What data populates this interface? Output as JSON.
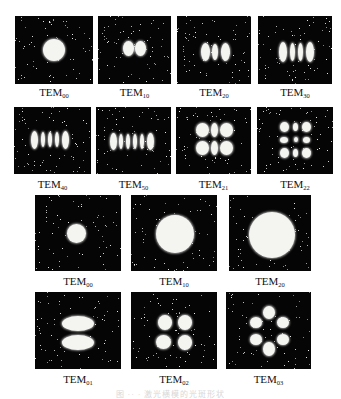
{
  "figure": {
    "rows": [
      {
        "name": "hermite-gaussian-row-1",
        "panels": [
          {
            "base": "TEM",
            "sub": "00",
            "pattern": "single-spot"
          },
          {
            "base": "TEM",
            "sub": "10",
            "pattern": "2-lobes-horizontal"
          },
          {
            "base": "TEM",
            "sub": "20",
            "pattern": "3-lobes-horizontal"
          },
          {
            "base": "TEM",
            "sub": "30",
            "pattern": "4-lobes-horizontal"
          }
        ]
      },
      {
        "name": "hermite-gaussian-row-2",
        "panels": [
          {
            "base": "TEM",
            "sub": "40",
            "pattern": "5-lobes-horizontal"
          },
          {
            "base": "TEM",
            "sub": "50",
            "pattern": "6-lobes-horizontal"
          },
          {
            "base": "TEM",
            "sub": "21",
            "pattern": "3x2-grid"
          },
          {
            "base": "TEM",
            "sub": "22",
            "pattern": "3x3-grid"
          }
        ]
      },
      {
        "name": "laguerre-gaussian-row-1",
        "panels": [
          {
            "base": "TEM",
            "sub": "00",
            "pattern": "small-disk"
          },
          {
            "base": "TEM",
            "sub": "10",
            "pattern": "medium-disk"
          },
          {
            "base": "TEM",
            "sub": "20",
            "pattern": "large-disk"
          }
        ]
      },
      {
        "name": "laguerre-gaussian-row-2",
        "panels": [
          {
            "base": "TEM",
            "sub": "01",
            "pattern": "2-petals"
          },
          {
            "base": "TEM",
            "sub": "02",
            "pattern": "4-petals"
          },
          {
            "base": "TEM",
            "sub": "03",
            "pattern": "6-petals"
          }
        ]
      }
    ],
    "caption": "图 ·· · 激光横模的光斑形状"
  },
  "colors": {
    "panel_bg": "#050505",
    "spot": "#f4f4f0",
    "label": "#111111",
    "caption": "#d8d8d8"
  }
}
